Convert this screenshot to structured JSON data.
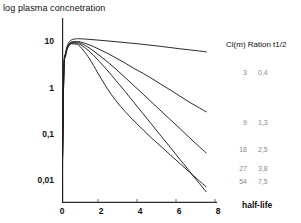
{
  "figure": {
    "yaxis_title": "log plasma concnetration",
    "xaxis_title": "half-life"
  },
  "legend": {
    "header": "Cl(m) Ration t1/2",
    "rows": [
      {
        "cl": "3",
        "ratio": "0,4",
        "top": 29
      },
      {
        "cl": "9",
        "ratio": "1,3",
        "top": 79
      },
      {
        "cl": "18",
        "ratio": "2,5",
        "top": 106
      },
      {
        "cl": "27",
        "ratio": "3,8",
        "top": 125
      },
      {
        "cl": "54",
        "ratio": "7,5",
        "top": 138
      }
    ]
  },
  "axes": {
    "y_ticks": [
      {
        "label": "10",
        "value": 10,
        "top": 41
      },
      {
        "label": "1",
        "value": 1,
        "top": 88
      },
      {
        "label": "0,1",
        "value": 0.1,
        "top": 134
      },
      {
        "label": "0,01",
        "value": 0.01,
        "top": 180
      }
    ],
    "x_ticks": [
      {
        "label": "0",
        "value": 0,
        "left": 59
      },
      {
        "label": "2",
        "value": 2,
        "left": 98
      },
      {
        "label": "4",
        "value": 4,
        "left": 137
      },
      {
        "label": "6",
        "value": 6,
        "left": 176
      },
      {
        "label": "8",
        "value": 8,
        "left": 215
      }
    ]
  },
  "chart_data": {
    "type": "line",
    "title": "",
    "xlabel": "half-life",
    "ylabel": "log plasma concnetration",
    "yscale": "log",
    "xlim": [
      0,
      8.6
    ],
    "ylim": [
      0.0018,
      40
    ],
    "grid": false,
    "legend_position": "right",
    "legend_columns": [
      "Cl(m)",
      "Ration t1/2"
    ],
    "x": [
      0,
      0.1,
      0.2,
      0.3,
      0.4,
      0.5,
      0.6,
      0.8,
      1.0,
      1.5,
      2.0,
      2.5,
      3.0,
      3.5,
      4.0,
      4.5,
      5.0,
      5.5,
      6.0,
      6.5,
      7.0,
      7.5,
      8.0
    ],
    "series": [
      {
        "name": "Cl(m) 3, Ration t1/2 0,4",
        "cl": 3,
        "ratio_t_half": 0.4,
        "values": [
          0.002,
          2.2,
          6.0,
          9.0,
          11.0,
          12.0,
          12.6,
          13.0,
          13.0,
          12.6,
          12.1,
          11.6,
          11.1,
          10.6,
          10.1,
          9.6,
          9.1,
          8.6,
          8.1,
          7.6,
          7.2,
          6.8,
          6.4
        ]
      },
      {
        "name": "Cl(m) 9, Ration t1/2 1,3",
        "cl": 9,
        "ratio_t_half": 1.3,
        "values": [
          0.002,
          2.1,
          5.7,
          8.4,
          10.0,
          10.8,
          11.1,
          11.2,
          11.0,
          9.4,
          7.6,
          6.0,
          4.6,
          3.5,
          2.6,
          2.0,
          1.5,
          1.1,
          0.82,
          0.6,
          0.44,
          0.33,
          0.25
        ]
      },
      {
        "name": "Cl(m) 18, Ration t1/2 2,5",
        "cl": 18,
        "ratio_t_half": 2.5,
        "values": [
          0.002,
          2.0,
          5.5,
          8.1,
          9.7,
          10.4,
          10.7,
          10.7,
          10.3,
          8.0,
          5.6,
          3.8,
          2.5,
          1.6,
          1.02,
          0.65,
          0.41,
          0.26,
          0.165,
          0.105,
          0.066,
          0.042,
          0.027
        ]
      },
      {
        "name": "Cl(m) 27, Ration t1/2 3,8",
        "cl": 27,
        "ratio_t_half": 3.8,
        "values": [
          0.002,
          1.9,
          5.3,
          7.9,
          9.4,
          10.1,
          10.3,
          10.2,
          9.6,
          6.7,
          4.1,
          2.4,
          1.35,
          0.75,
          0.41,
          0.225,
          0.123,
          0.067,
          0.037,
          0.02,
          0.011,
          0.006,
          0.0033
        ]
      },
      {
        "name": "Cl(m) 54, Ration t1/2 7,5",
        "cl": 54,
        "ratio_t_half": 7.5,
        "values": [
          0.002,
          1.8,
          5.1,
          7.6,
          9.1,
          9.8,
          9.9,
          9.6,
          8.6,
          4.6,
          2.0,
          0.9,
          0.45,
          0.255,
          0.152,
          0.094,
          0.059,
          0.038,
          0.0245,
          0.0158,
          0.0102,
          0.0066,
          0.0043
        ]
      }
    ]
  }
}
